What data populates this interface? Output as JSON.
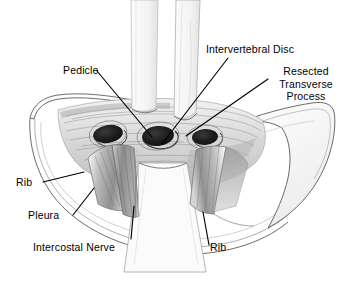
{
  "figure": {
    "background_color": "#ffffff",
    "ink_color": "#000000",
    "shading_color": "#8a8a8a"
  },
  "labels": {
    "pedicle": "Pedicle",
    "intervertebral_disc": "Intervertebral Disc",
    "resected_transverse_process_line1": "Resected",
    "resected_transverse_process_line2": "Transverse",
    "resected_transverse_process_line3": "Process",
    "rib_left": "Rib",
    "pleura": "Pleura",
    "intercostal_nerve": "Intercostal Nerve",
    "rib_right": "Rib"
  },
  "leader_lines": [
    {
      "name": "pedicle-leader",
      "from": [
        97,
        71
      ],
      "to": [
        152,
        137
      ]
    },
    {
      "name": "intervertebral-disc-leader",
      "from": [
        228,
        58
      ],
      "to": [
        162,
        144
      ]
    },
    {
      "name": "resected-transverse-process-leader",
      "from": [
        268,
        79
      ],
      "to": [
        186,
        136
      ]
    },
    {
      "name": "rib-left-leader",
      "from": [
        43,
        182
      ],
      "to": [
        84,
        172
      ]
    },
    {
      "name": "pleura-leader",
      "from": [
        73,
        215
      ],
      "to": [
        94,
        188
      ]
    },
    {
      "name": "intercostal-nerve-leader",
      "from": [
        131,
        239
      ],
      "to": [
        134,
        206
      ]
    },
    {
      "name": "rib-right-leader",
      "from": [
        209,
        245
      ],
      "to": [
        203,
        212
      ]
    }
  ]
}
